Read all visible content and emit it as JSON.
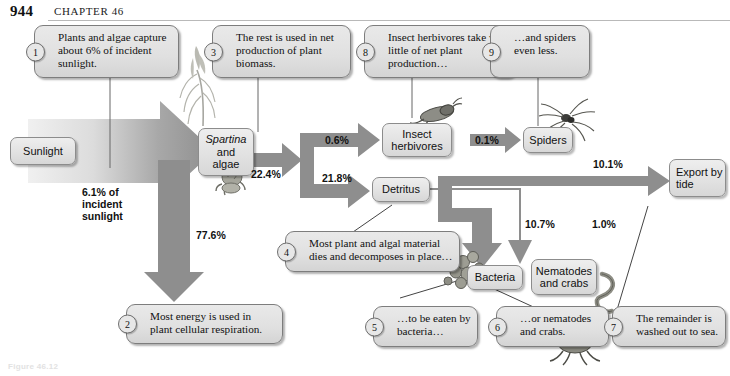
{
  "page": {
    "number": "944",
    "chapter": "CHAPTER 46",
    "figure_caption": "Figure 46.12"
  },
  "nodes": [
    {
      "id": "sunlight",
      "label": "Sunlight"
    },
    {
      "id": "spartina",
      "label_italic": "Spartina",
      "label_line2": "and",
      "label_line3": "algae"
    },
    {
      "id": "insect",
      "label_line1": "Insect",
      "label_line2": "herbivores"
    },
    {
      "id": "spiders",
      "label": "Spiders"
    },
    {
      "id": "detritus",
      "label": "Detritus"
    },
    {
      "id": "export",
      "label_line1": "Export by",
      "label_line2": "tide"
    },
    {
      "id": "bacteria",
      "label": "Bacteria"
    },
    {
      "id": "nematodes",
      "label_line1": "Nematodes",
      "label_line2": "and crabs"
    }
  ],
  "flows": {
    "sunlight_to_plant": "6.1% of\nincident\nsunlight",
    "sunlight_line1": "6.1% of",
    "sunlight_line2": "incident",
    "sunlight_line3": "sunlight",
    "plant_to_net": "22.4%",
    "plant_to_respiration": "77.6%",
    "net_to_insect": "0.6%",
    "net_to_detritus": "21.8%",
    "insect_to_spiders": "0.1%",
    "detritus_to_export": "10.1%",
    "detritus_to_bacteria": "10.7%",
    "detritus_to_nematodes": "1.0%"
  },
  "callouts": [
    {
      "num": "1",
      "text": "Plants and algae capture about 6% of incident sunlight."
    },
    {
      "num": "2",
      "text": "Most energy is used in plant cellular respiration."
    },
    {
      "num": "3",
      "text": "The rest is used in net production of plant biomass."
    },
    {
      "num": "4",
      "text": "Most plant and algal material dies and decomposes in place…"
    },
    {
      "num": "5",
      "text": "…to be eaten by bacteria…"
    },
    {
      "num": "6",
      "text": "…or nematodes and crabs."
    },
    {
      "num": "7",
      "text": "The remainder is washed out to sea."
    },
    {
      "num": "8",
      "text": "Insect herbivores take very little of net plant production…"
    },
    {
      "num": "9",
      "text": "…and spiders even less."
    }
  ],
  "colors": {
    "arrow_gray": "#8e8e8e",
    "arrow_dark": "#7c7c7c",
    "box_fill": "#e3e3e3",
    "box_border": "#8c8c8c",
    "leader_line": "#555555",
    "page_text": "#111111"
  },
  "organisms": [
    {
      "id": "spartina-plant-art",
      "name": "spartina-grass-illustration"
    },
    {
      "id": "snail-art",
      "name": "snail-illustration"
    },
    {
      "id": "insect-art",
      "name": "grasshopper-illustration"
    },
    {
      "id": "spider-art",
      "name": "spider-illustration"
    },
    {
      "id": "bacteria-art",
      "name": "bacteria-cluster-illustration"
    },
    {
      "id": "crab-art",
      "name": "crab-illustration"
    },
    {
      "id": "nematode-art",
      "name": "nematode-worm-illustration"
    }
  ]
}
